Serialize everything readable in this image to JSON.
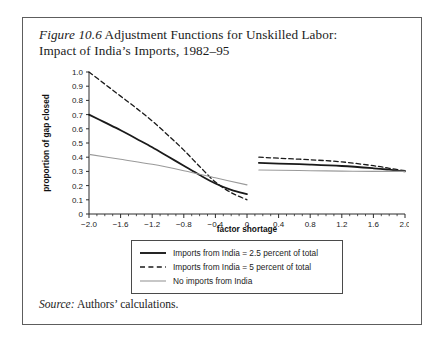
{
  "figure": {
    "number_label": "Figure 10.6",
    "title_rest": " Adjustment Functions for Unskilled Labor:",
    "title_line2": "Impact of India’s Imports, 1982–95",
    "source_label": "Source:",
    "source_text": " Authors’ calculations."
  },
  "legend": {
    "items": [
      {
        "label": "Imports from India = 2.5 percent of total",
        "style": "solid",
        "color": "#1a1a1a"
      },
      {
        "label": "Imports from India = 5 percent of total",
        "style": "dashed",
        "color": "#1a1a1a"
      },
      {
        "label": "No imports from India",
        "style": "thin",
        "color": "#9a9a9a"
      }
    ]
  },
  "chart_data": {
    "type": "line",
    "title": "Adjustment Functions for Unskilled Labor: Impact of India’s Imports, 1982–95",
    "xlabel": "factor shortage",
    "ylabel": "proportion of gap closed",
    "xlim": [
      -2.0,
      2.0
    ],
    "ylim": [
      0,
      1.0
    ],
    "xticks": [
      -2.0,
      -1.6,
      -1.2,
      -0.8,
      -0.4,
      0,
      0.4,
      0.8,
      1.2,
      1.6,
      2.0
    ],
    "xtick_labels": [
      "−2.0",
      "−1.6",
      "−1.2",
      "−0.8",
      "−0.4",
      "0",
      "0.4",
      "0.8",
      "1.2",
      "1.6",
      "2.0"
    ],
    "yticks": [
      0,
      0.1,
      0.2,
      0.3,
      0.4,
      0.5,
      0.6,
      0.7,
      0.8,
      0.9,
      1.0
    ],
    "ytick_labels": [
      "0",
      "0.1",
      "0.2",
      "0.3",
      "0.4",
      "0.5",
      "0.6",
      "0.7",
      "0.8",
      "0.9",
      "1.0"
    ],
    "minor_xtick_step": 0.1,
    "grid": false,
    "legend_position": "below-plot",
    "note": "Curves are discontinuous at the origin: a left branch spans x=-2.0 to x=0 and a right branch spans x=0.15 to x=2.0.",
    "series": [
      {
        "name": "Imports from India = 2.5 percent of total",
        "style": "solid",
        "color": "#1a1a1a",
        "width": 1.8,
        "left_branch": {
          "x": [
            -2.0,
            -1.8,
            -1.6,
            -1.4,
            -1.2,
            -1.0,
            -0.8,
            -0.6,
            -0.4,
            -0.2,
            0.0
          ],
          "y": [
            0.7,
            0.645,
            0.59,
            0.53,
            0.47,
            0.405,
            0.34,
            0.275,
            0.215,
            0.17,
            0.14
          ]
        },
        "right_branch": {
          "x": [
            0.15,
            0.4,
            0.8,
            1.2,
            1.6,
            1.8,
            2.0
          ],
          "y": [
            0.36,
            0.355,
            0.348,
            0.338,
            0.322,
            0.312,
            0.3
          ]
        }
      },
      {
        "name": "Imports from India = 5 percent of total",
        "style": "dashed",
        "color": "#1a1a1a",
        "width": 1.3,
        "left_branch": {
          "x": [
            -2.0,
            -1.8,
            -1.6,
            -1.4,
            -1.2,
            -1.0,
            -0.8,
            -0.6,
            -0.4,
            -0.2,
            0.0
          ],
          "y": [
            1.0,
            0.915,
            0.83,
            0.745,
            0.655,
            0.555,
            0.45,
            0.335,
            0.225,
            0.15,
            0.1
          ]
        },
        "right_branch": {
          "x": [
            0.15,
            0.4,
            0.8,
            1.2,
            1.6,
            1.8,
            2.0
          ],
          "y": [
            0.4,
            0.393,
            0.382,
            0.367,
            0.34,
            0.322,
            0.305
          ]
        }
      },
      {
        "name": "No imports from India",
        "style": "thin",
        "color": "#9a9a9a",
        "width": 1.1,
        "left_branch": {
          "x": [
            -2.0,
            -1.6,
            -1.2,
            -0.8,
            -0.4,
            0.0
          ],
          "y": [
            0.42,
            0.385,
            0.35,
            0.305,
            0.255,
            0.205
          ]
        },
        "right_branch": {
          "x": [
            0.15,
            0.4,
            0.8,
            1.2,
            1.6,
            1.8,
            2.0
          ],
          "y": [
            0.31,
            0.308,
            0.305,
            0.302,
            0.3,
            0.3,
            0.3
          ]
        }
      }
    ]
  }
}
